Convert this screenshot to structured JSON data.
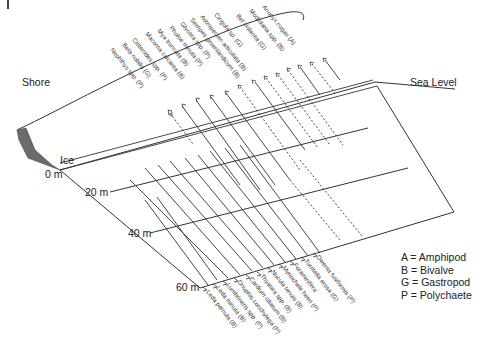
{
  "labels": {
    "shore": "Shore",
    "sea_level": "Sea Level",
    "ice": "Ice"
  },
  "depths": [
    "0 m",
    "20 m",
    "40 m",
    "60 m"
  ],
  "legend": [
    {
      "code": "A",
      "meaning": "Amphipod",
      "text": "A = Amphipod"
    },
    {
      "code": "B",
      "meaning": "Bivalve",
      "text": "B = Bivalve"
    },
    {
      "code": "G",
      "meaning": "Gastropod",
      "text": "G = Gastropod"
    },
    {
      "code": "P",
      "meaning": "Polychaete",
      "text": "P = Polychaete"
    }
  ],
  "shallow_species": [
    {
      "name": "Nephthys spp. (P)"
    },
    {
      "name": "Bela nobilis (G)"
    },
    {
      "name": "Cistenides spp. (P)"
    },
    {
      "name": "Macoma calcarea (B)"
    },
    {
      "name": "Mya truncata (B)"
    },
    {
      "name": "Pholoe minuta (P)"
    },
    {
      "name": "Glycera spp. (P)"
    },
    {
      "name": "Serripes groenlandicum (B)"
    },
    {
      "name": "Astropecten articulata (B)"
    },
    {
      "name": "Cingula sp. (G)"
    },
    {
      "name": "Bel violacea (G)"
    },
    {
      "name": "Modiolaria spp. (B)"
    },
    {
      "name": "Anonyx nugax (A)"
    }
  ],
  "deep_species": [
    {
      "name": "Leda pernula (B)"
    },
    {
      "name": "Leda minuta (B)"
    },
    {
      "name": "Lumbrineris spp. (P)"
    },
    {
      "name": "Onuphis conchylega (P)"
    },
    {
      "name": "Cardium ciliatum (B)"
    },
    {
      "name": "Thyasira spp. (B)"
    },
    {
      "name": "Nucula tenuis (B)"
    },
    {
      "name": "Myriochele heeri (P)"
    },
    {
      "name": "Foraminifera"
    },
    {
      "name": "Turritella erosa (G)"
    },
    {
      "name": "Owenia fusiformis (P)"
    }
  ],
  "colors": {
    "line": "#333333",
    "shore_fill": "#6b6b6b",
    "text": "#222222"
  }
}
